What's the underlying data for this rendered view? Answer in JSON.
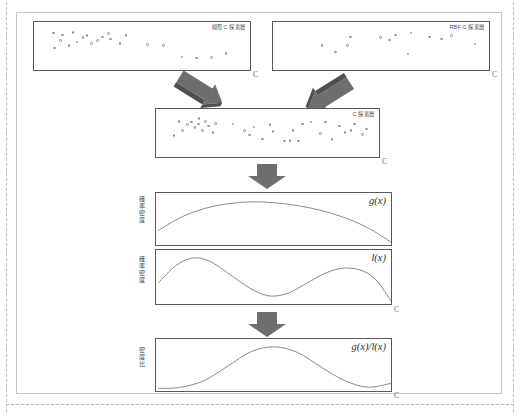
{
  "figure": {
    "title_semantic": "density-ratio-acquisition-diagram",
    "axis_x_label": "C",
    "colors": {
      "panel_border": "#585858",
      "frame_border": "#c6c6c6",
      "arrow_fill": "#6e6e6e",
      "arrow_fill_dark": "#4f4f4f",
      "curve": "#8a8a8a",
      "dot_stroke": "#8d8d8d",
      "text": "#4a4a4a"
    }
  },
  "panels": {
    "linear": {
      "name": "linear-c-search-space",
      "label": "線形 C 探索層",
      "axis_x": "C",
      "axis_y": ""
    },
    "rbf": {
      "name": "rbf-c-search-space",
      "label": "RBF C 探索層",
      "axis_x": "C",
      "axis_y": ""
    },
    "merged": {
      "name": "merged-c-search-space",
      "label": "C 探索層",
      "axis_x": "C",
      "axis_y": ""
    },
    "gx": {
      "name": "good-density-panel",
      "label": "g(x)",
      "axis_y": "確率密度",
      "axis_x": ""
    },
    "lx": {
      "name": "bad-density-panel",
      "label": "l(x)",
      "axis_y": "確率密度",
      "axis_x": "C"
    },
    "ratio": {
      "name": "density-ratio-panel",
      "label": "g(x)/l(x)",
      "axis_y": "密度比",
      "axis_x": "C"
    }
  },
  "chart_data": {
    "type": "scatter",
    "title": "",
    "xlabel": "C",
    "ylabel": "",
    "scatter_sets": {
      "linear": {
        "label": "線形 C 探索層",
        "n_points": 22,
        "points": [
          [
            0.065,
            0.48
          ],
          [
            0.135,
            0.56
          ],
          [
            0.175,
            0.66
          ],
          [
            0.205,
            0.78
          ],
          [
            0.105,
            0.86
          ],
          [
            0.245,
            0.62
          ],
          [
            0.275,
            0.7
          ],
          [
            0.3,
            0.8
          ],
          [
            0.34,
            0.74
          ],
          [
            0.385,
            0.62
          ],
          [
            0.415,
            0.84
          ],
          [
            0.33,
            0.9
          ],
          [
            0.155,
            0.94
          ],
          [
            0.095,
            0.7
          ],
          [
            0.225,
            0.84
          ],
          [
            0.52,
            0.58
          ],
          [
            0.6,
            0.56
          ],
          [
            0.69,
            0.22
          ],
          [
            0.76,
            0.18
          ],
          [
            0.835,
            0.2
          ],
          [
            0.905,
            0.32
          ],
          [
            0.06,
            0.92
          ]
        ]
      },
      "rbf": {
        "label": "RBF C 探索層",
        "n_points": 13,
        "points": [
          [
            0.205,
            0.56
          ],
          [
            0.27,
            0.36
          ],
          [
            0.33,
            0.56
          ],
          [
            0.345,
            0.8
          ],
          [
            0.49,
            0.78
          ],
          [
            0.535,
            0.72
          ],
          [
            0.565,
            0.86
          ],
          [
            0.625,
            0.3
          ],
          [
            0.64,
            0.92
          ],
          [
            0.73,
            0.8
          ],
          [
            0.79,
            0.74
          ],
          [
            0.84,
            0.84
          ],
          [
            0.955,
            0.6
          ]
        ]
      },
      "merged": {
        "label": "C 探索層",
        "n_points": 35,
        "points": [
          [
            0.05,
            0.46
          ],
          [
            0.092,
            0.62
          ],
          [
            0.115,
            0.78
          ],
          [
            0.135,
            0.86
          ],
          [
            0.15,
            0.7
          ],
          [
            0.168,
            0.8
          ],
          [
            0.185,
            0.62
          ],
          [
            0.2,
            0.88
          ],
          [
            0.215,
            0.74
          ],
          [
            0.235,
            0.56
          ],
          [
            0.248,
            0.82
          ],
          [
            0.17,
            0.96
          ],
          [
            0.075,
            0.88
          ],
          [
            0.33,
            0.8
          ],
          [
            0.385,
            0.62
          ],
          [
            0.408,
            0.48
          ],
          [
            0.43,
            0.72
          ],
          [
            0.47,
            0.36
          ],
          [
            0.505,
            0.78
          ],
          [
            0.52,
            0.58
          ],
          [
            0.575,
            0.3
          ],
          [
            0.6,
            0.32
          ],
          [
            0.615,
            0.62
          ],
          [
            0.64,
            0.3
          ],
          [
            0.66,
            0.8
          ],
          [
            0.7,
            0.86
          ],
          [
            0.745,
            0.52
          ],
          [
            0.77,
            0.86
          ],
          [
            0.8,
            0.34
          ],
          [
            0.835,
            0.74
          ],
          [
            0.862,
            0.56
          ],
          [
            0.89,
            0.62
          ],
          [
            0.905,
            0.8
          ],
          [
            0.945,
            0.5
          ],
          [
            0.962,
            0.66
          ]
        ]
      }
    },
    "curves": {
      "gx": {
        "label": "g(x)",
        "ylabel": "確率密度",
        "description": "broad unimodal concave curve peaking left-of-center",
        "x": [
          0.0,
          0.1,
          0.2,
          0.3,
          0.4,
          0.5,
          0.6,
          0.7,
          0.8,
          0.9,
          1.0
        ],
        "y": [
          0.3,
          0.58,
          0.76,
          0.86,
          0.9,
          0.88,
          0.82,
          0.72,
          0.57,
          0.36,
          0.06
        ]
      },
      "lx": {
        "label": "l(x)",
        "ylabel": "確率密度",
        "description": "bimodal curve, tall left mode, lower right mode",
        "x": [
          0.0,
          0.08,
          0.15,
          0.22,
          0.3,
          0.4,
          0.48,
          0.56,
          0.64,
          0.72,
          0.8,
          0.88,
          0.94,
          1.0
        ],
        "y": [
          0.42,
          0.78,
          0.92,
          0.86,
          0.62,
          0.3,
          0.16,
          0.22,
          0.42,
          0.62,
          0.72,
          0.66,
          0.46,
          0.06
        ]
      },
      "ratio": {
        "label": "g(x)/l(x)",
        "ylabel": "密度比",
        "description": "single broad peak centered, low tails rising slightly at right",
        "x": [
          0.0,
          0.1,
          0.2,
          0.3,
          0.4,
          0.5,
          0.6,
          0.7,
          0.8,
          0.9,
          1.0
        ],
        "y": [
          0.05,
          0.08,
          0.22,
          0.52,
          0.82,
          0.92,
          0.8,
          0.5,
          0.22,
          0.08,
          0.16
        ]
      }
    }
  }
}
